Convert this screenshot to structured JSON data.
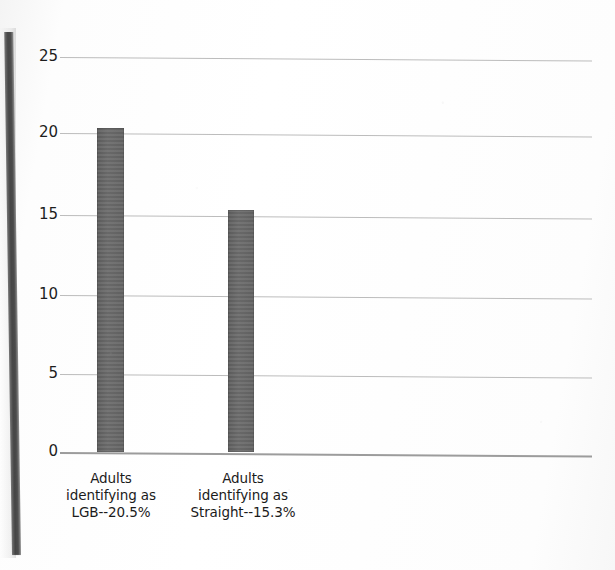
{
  "chart_data": {
    "type": "bar",
    "title": "",
    "subtitle": "",
    "xlabel": "",
    "ylabel": "",
    "categories": [
      "Adults identifying as LGB--20.5%",
      "Adults identifying as Straight--15.3%"
    ],
    "category_lines": [
      [
        "Adults",
        "identifying as",
        "LGB--20.5%"
      ],
      [
        "Adults",
        "identifying as",
        "Straight--15.3%"
      ]
    ],
    "values": [
      20.5,
      15.3
    ],
    "ylim": [
      0,
      25
    ],
    "ytick_labels": [
      "0",
      "5",
      "10",
      "15",
      "20",
      "25"
    ],
    "ytick_values": [
      0,
      5,
      10,
      15,
      20,
      25
    ],
    "grid": true,
    "legend": false,
    "legend_position": "none",
    "bar_color": "#666666",
    "gridline_color": "#bcbcbc",
    "axis_color": "#9c9c9c",
    "background_color": "#ffffff",
    "text_color": "#1b1b1b",
    "annotations": []
  },
  "artifacts": {
    "spine_shadow_name": "scanner-spine-shadow",
    "spine_color": "#3c3c3c"
  }
}
